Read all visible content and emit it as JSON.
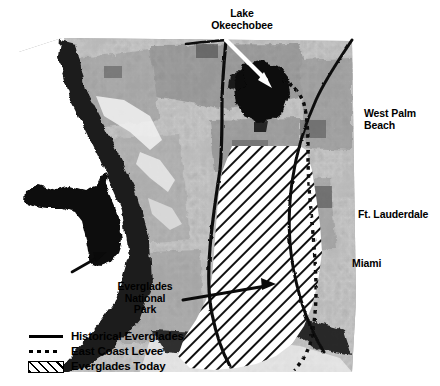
{
  "figure": {
    "kind": "map-figure",
    "background_color": "#ffffff",
    "basemap_style": "grayscale satellite imagery"
  },
  "map_labels": {
    "lake_okeechobee": "Lake\nOkeechobee",
    "west_palm_beach": "West Palm\nBeach",
    "ft_lauderdale": "Ft. Lauderdale",
    "miami": "Miami",
    "everglades_national_park": "Everglades\nNational\nPark"
  },
  "annotations": {
    "lake_arrow": {
      "name": "lake-okeechobee-arrow",
      "color": "#ffffff",
      "points_to": "Lake Okeechobee"
    },
    "park_arrow": {
      "name": "everglades-national-park-arrow",
      "color": "#000000",
      "points_to": "Everglades National Park"
    },
    "inset_arrow": {
      "name": "inset-locator-arrow",
      "color": "#000000",
      "points_to": "South Florida on Florida state inset"
    }
  },
  "inset": {
    "name": "florida-state-inset",
    "shape": "Florida state silhouette",
    "fill_color": "#000000"
  },
  "legend": {
    "items": [
      {
        "symbol": "solid-line",
        "label": "Historical Everglades",
        "color": "#000000"
      },
      {
        "symbol": "dashed-line",
        "label": "East Coast Levee",
        "color": "#000000"
      },
      {
        "symbol": "hatch-box",
        "label": "Everglades Today",
        "color": "#000000"
      }
    ]
  },
  "map_features": {
    "historical_everglades_boundary": "solid black line",
    "east_coast_levee": "dotted black line",
    "everglades_today": "diagonal hatched area"
  }
}
